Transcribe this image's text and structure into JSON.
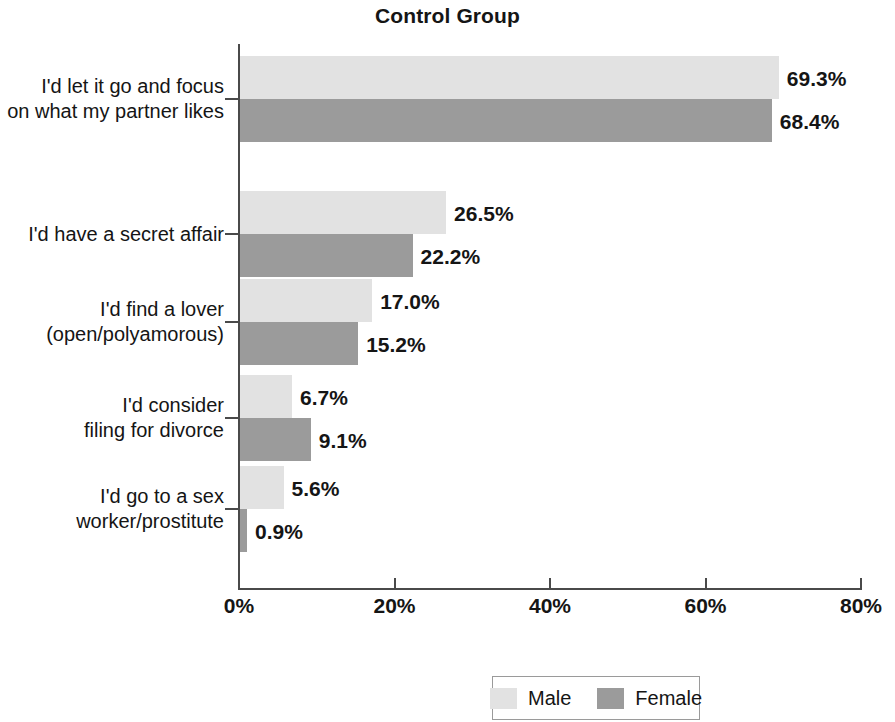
{
  "chart_data": {
    "type": "bar",
    "orientation": "horizontal",
    "title": "Control Group",
    "xlabel": "",
    "ylabel": "",
    "xlim": [
      0,
      80
    ],
    "xticks": [
      "0%",
      "20%",
      "40%",
      "60%",
      "80%"
    ],
    "xtick_values": [
      0,
      20,
      40,
      60,
      80
    ],
    "grid": false,
    "legend_position": "bottom-center",
    "categories": [
      "I'd let it go and focus\non what my partner likes",
      "I'd have a secret affair",
      "I'd find a lover\n(open/polyamorous)",
      "I'd consider\nfiling for divorce",
      "I'd go to a sex\nworker/prostitute"
    ],
    "series": [
      {
        "name": "Male",
        "color": "#e2e2e2",
        "values": [
          69.3,
          26.5,
          17.0,
          6.7,
          5.6
        ],
        "labels": [
          "69.3%",
          "26.5%",
          "17.0%",
          "6.7%",
          "5.6%"
        ]
      },
      {
        "name": "Female",
        "color": "#9b9b9b",
        "values": [
          68.4,
          22.2,
          15.2,
          9.1,
          0.9
        ],
        "labels": [
          "68.4%",
          "22.2%",
          "15.2%",
          "9.1%",
          "0.9%"
        ]
      }
    ]
  },
  "legend": {
    "items": [
      {
        "label": "Male",
        "color": "#e2e2e2"
      },
      {
        "label": "Female",
        "color": "#9b9b9b"
      }
    ]
  }
}
